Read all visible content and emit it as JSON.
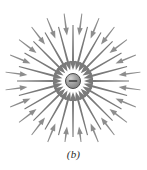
{
  "figure": {
    "caption": "(b)",
    "background_color": "#ffffff"
  },
  "charge": {
    "symbol": "−",
    "sign": "negative",
    "center_x": 73,
    "center_y": 81,
    "radius": 7.5,
    "fill_color": "#9a9a9a",
    "edge_color": "#4d4d4d",
    "highlight_color": "#c9c9c9",
    "symbol_color": "#3a3a3a"
  },
  "arrows": {
    "color": "#8d8d8d",
    "dark_color": "#7a7a7a",
    "direction": "inward",
    "description": "Gray arrows point radially inward toward the central negative charge",
    "inner_ring": {
      "count": 24,
      "tail_radius": 56,
      "head_radius": 11,
      "shaft_width": 2.0,
      "head_width": 6.5,
      "head_length": 9,
      "angles_deg": [
        0,
        15,
        30,
        45,
        60,
        75,
        90,
        105,
        120,
        135,
        150,
        165,
        180,
        195,
        210,
        225,
        240,
        255,
        270,
        285,
        300,
        315,
        330,
        345
      ]
    },
    "outer_ring": {
      "count": 24,
      "tail_radius": 68,
      "head_radius": 46,
      "shaft_width": 1.7,
      "head_width": 5.6,
      "head_length": 7.5,
      "angles_deg": [
        7.5,
        22.5,
        37.5,
        52.5,
        67.5,
        82.5,
        97.5,
        112.5,
        127.5,
        142.5,
        157.5,
        172.5,
        187.5,
        202.5,
        217.5,
        232.5,
        247.5,
        262.5,
        277.5,
        292.5,
        307.5,
        322.5,
        337.5,
        352.5
      ]
    }
  }
}
